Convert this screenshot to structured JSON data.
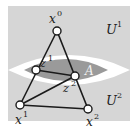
{
  "colors": {
    "background": "#ffffff",
    "region": "#d6d6d6",
    "lens": "#9a9a9a",
    "edge": "#1a1a1a",
    "node_fill": "#ffffff",
    "node_stroke": "#1a1a1a"
  },
  "regions": [
    {
      "id": "U1",
      "label": "U",
      "sup": "1"
    },
    {
      "id": "U2",
      "label": "U",
      "sup": "2"
    },
    {
      "id": "A",
      "label": "A"
    }
  ],
  "nodes": [
    {
      "id": "x0",
      "label": "x",
      "sup": "0",
      "x": 57,
      "y": 31
    },
    {
      "id": "z1",
      "label": "z",
      "sup": "1",
      "x": 36,
      "y": 70
    },
    {
      "id": "z2",
      "label": "z",
      "sup": "2",
      "x": 75,
      "y": 76
    },
    {
      "id": "x1",
      "label": "x",
      "sup": "1",
      "x": 20,
      "y": 105
    },
    {
      "id": "x2",
      "label": "x",
      "sup": "2",
      "x": 88,
      "y": 109
    }
  ],
  "edges": [
    [
      "x0",
      "x1"
    ],
    [
      "x0",
      "x2"
    ],
    [
      "x1",
      "x2"
    ],
    [
      "z1",
      "z2"
    ],
    [
      "x1",
      "z2"
    ]
  ]
}
